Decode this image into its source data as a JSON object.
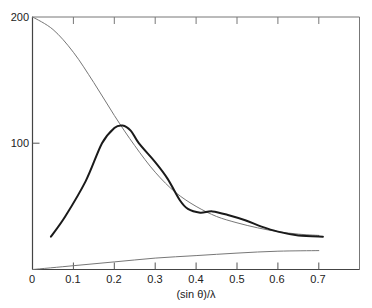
{
  "chart_data": {
    "type": "line",
    "title": "",
    "xlabel": "(sin θ)/λ",
    "ylabel": "",
    "xlim": [
      0,
      0.8
    ],
    "ylim": [
      0,
      200
    ],
    "x_ticks": [
      "0",
      "0.1",
      "0.2",
      "0.3",
      "0.4",
      "0.5",
      "0.6",
      "0.7"
    ],
    "y_ticks": [
      "0",
      "100",
      "200"
    ],
    "grid": false,
    "legend": null,
    "series": [
      {
        "name": "thin decreasing curve",
        "style": "thin gray",
        "x": [
          0,
          0.05,
          0.1,
          0.15,
          0.2,
          0.25,
          0.3,
          0.35,
          0.4,
          0.45,
          0.5,
          0.55,
          0.6,
          0.65,
          0.7
        ],
        "y": [
          200,
          190,
          172,
          148,
          122,
          98,
          77,
          61,
          50,
          42,
          37,
          33,
          30,
          28,
          27
        ]
      },
      {
        "name": "thick peaked curve",
        "style": "thick black",
        "x": [
          0.045,
          0.08,
          0.13,
          0.17,
          0.2,
          0.22,
          0.24,
          0.26,
          0.3,
          0.33,
          0.36,
          0.38,
          0.41,
          0.44,
          0.48,
          0.52,
          0.56,
          0.6,
          0.65,
          0.71
        ],
        "y": [
          26,
          42,
          70,
          100,
          112,
          114,
          110,
          100,
          85,
          72,
          55,
          48,
          45,
          46,
          43,
          39,
          34,
          30,
          27,
          26
        ]
      },
      {
        "name": "thin increasing curve",
        "style": "thin gray",
        "x": [
          0,
          0.1,
          0.2,
          0.3,
          0.4,
          0.5,
          0.6,
          0.7
        ],
        "y": [
          0,
          3,
          6,
          9,
          11,
          13,
          14.5,
          15
        ]
      }
    ]
  },
  "labels": {
    "y200": "200",
    "y100": "100",
    "x0": "0",
    "x1": "0.1",
    "x2": "0.2",
    "x3": "0.3",
    "x4": "0.4",
    "x5": "0.5",
    "x6": "0.6",
    "x7": "0.7",
    "xtitle": "(sin θ)/λ"
  }
}
